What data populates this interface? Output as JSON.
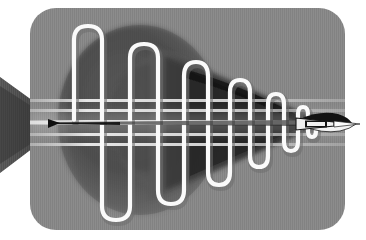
{
  "figure": {
    "canvas": {
      "width": 366,
      "height": 240,
      "background": "#ffffff"
    },
    "panel": {
      "name": "rounded-gray-panel",
      "x": 30,
      "y": 8,
      "width": 315,
      "height": 222,
      "corner_radius": 26,
      "fill": "#8c8c8c"
    },
    "colors": {
      "background": "#ffffff",
      "panel_gray": "#8c8c8c",
      "dark_mass": "#4a4a4a",
      "darker_core": "#3a3a3a",
      "mid_gray": "#6f6f6f",
      "light_gray": "#b5b5b5",
      "band_light": "#e3e3e3",
      "tube_white": "#f5f5f5",
      "tube_shadow": "#9a9a9a",
      "arrow_black": "#141414",
      "arrow_white": "#f2f2f2",
      "wedge_dark": "#3f3f3f"
    },
    "elements": [
      {
        "name": "left-wedge",
        "type": "triangle",
        "desc": "dark striped wedge entering from left edge, apex pointing right"
      },
      {
        "name": "dark-sphere",
        "type": "ellipse",
        "desc": "large dark elliptical mass centered left-of-center"
      },
      {
        "name": "taper-cone",
        "type": "cone",
        "desc": "dark cone narrowing from sphere toward right tip"
      },
      {
        "name": "serpentine-tube",
        "type": "path",
        "desc": "white square-wave coil with rounded ends, decaying amplitude left to right"
      },
      {
        "name": "horizontal-bands",
        "type": "lines",
        "desc": "five light horizontal beams crossing the figure"
      },
      {
        "name": "arrow-dart",
        "type": "polygon",
        "desc": "black and white dart / arrowhead at right tip"
      }
    ],
    "serpentine": {
      "stroke_width": 4,
      "x_start": 74,
      "x_end": 300,
      "center_y": 122,
      "cycles": 8,
      "amplitude_start": 102,
      "amplitude_end": 6,
      "peaks_x": [
        78,
        108,
        138,
        164,
        188,
        210,
        228,
        244,
        258,
        270,
        280,
        288,
        294
      ],
      "peak_y_top": [
        22,
        38,
        58,
        73,
        85,
        95,
        103,
        109,
        113,
        116,
        118,
        120,
        121
      ],
      "peak_y_bottom": [
        222,
        206,
        186,
        171,
        159,
        149,
        141,
        135,
        131,
        128,
        126,
        124,
        123
      ]
    },
    "bands": {
      "count": 5,
      "y_positions": [
        100,
        110,
        122,
        134,
        144
      ],
      "thickness": [
        3,
        3,
        5,
        3,
        3
      ],
      "x_start": 34,
      "x_end": 344
    },
    "arrow": {
      "tip_x": 352,
      "tip_y": 124,
      "length": 56,
      "height": 22
    }
  }
}
